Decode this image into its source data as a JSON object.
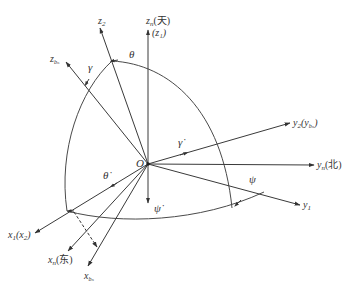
{
  "diagram": {
    "type": "coordinate-frame-rotation",
    "origin_label": "O",
    "axes": [
      {
        "id": "zn",
        "label": "z",
        "sub": "n",
        "suffix": "(天)",
        "line2": "(z₁)"
      },
      {
        "id": "z2",
        "label": "z",
        "sub": "2"
      },
      {
        "id": "zbn",
        "label": "z",
        "sub": "bₙ"
      },
      {
        "id": "y2",
        "label": "y",
        "sub": "2",
        "suffix": "(y",
        "suffix_sub": "bₙ",
        "suffix_end": ")"
      },
      {
        "id": "yn",
        "label": "y",
        "sub": "n",
        "suffix": "(北)"
      },
      {
        "id": "y1",
        "label": "y",
        "sub": "1"
      },
      {
        "id": "x1",
        "label": "x",
        "sub": "1",
        "suffix": "(x",
        "suffix_sub": "2",
        "suffix_end": ")"
      },
      {
        "id": "xn",
        "label": "x",
        "sub": "n",
        "suffix": "(东)"
      },
      {
        "id": "xbn",
        "label": "x",
        "sub": "bₙ"
      }
    ],
    "angles": {
      "theta": "θ",
      "gamma": "γ",
      "psi": "ψ"
    },
    "rates": {
      "theta_dot": "θ̇",
      "gamma_dot": "γ̇",
      "psi_dot": "ψ̇"
    }
  }
}
